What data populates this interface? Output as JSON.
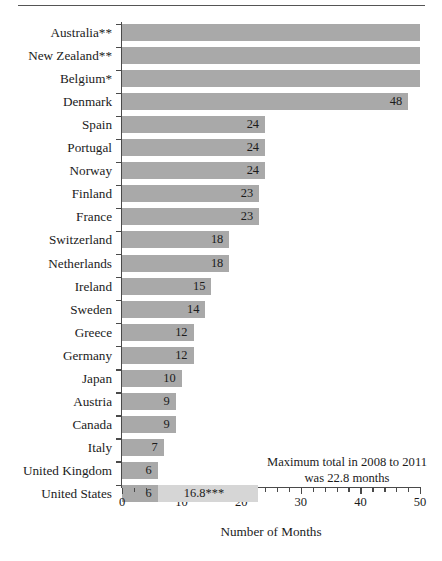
{
  "chart_data": {
    "type": "bar",
    "orientation": "horizontal",
    "title": "",
    "xlabel": "Number of Months",
    "ylabel": "",
    "xlim": [
      0,
      50
    ],
    "xticks": [
      0,
      10,
      20,
      30,
      40,
      50
    ],
    "xtick_labels": [
      "0",
      "10",
      "20",
      "30",
      "40",
      "50"
    ],
    "grid": false,
    "legend": null,
    "bar_color": "#a9a9a9",
    "extension_color": "#d6d6d6",
    "categories": [
      "Australia**",
      "New Zealand**",
      "Belgium*",
      "Denmark",
      "Spain",
      "Portugal",
      "Norway",
      "Finland",
      "France",
      "Switzerland",
      "Netherlands",
      "Ireland",
      "Sweden",
      "Greece",
      "Germany",
      "Japan",
      "Austria",
      "Canada",
      "Italy",
      "United Kingdom",
      "United States"
    ],
    "values": [
      50,
      50,
      50,
      48,
      24,
      24,
      24,
      23,
      23,
      18,
      18,
      15,
      14,
      12,
      12,
      10,
      9,
      9,
      7,
      6,
      6
    ],
    "value_labels": [
      "",
      "",
      "",
      "48",
      "24",
      "24",
      "24",
      "23",
      "23",
      "18",
      "18",
      "15",
      "14",
      "12",
      "12",
      "10",
      "9",
      "9",
      "7",
      "6",
      "6"
    ],
    "clipped": [
      true,
      true,
      true,
      false,
      false,
      false,
      false,
      false,
      false,
      false,
      false,
      false,
      false,
      false,
      false,
      false,
      false,
      false,
      false,
      false,
      false
    ],
    "extension": {
      "category": "United States",
      "from": 6,
      "to": 22.8,
      "label": "16.8***"
    },
    "annotation": {
      "line1": "Maximum total in 2008 to 2011",
      "line2": "was 22.8 months"
    }
  }
}
